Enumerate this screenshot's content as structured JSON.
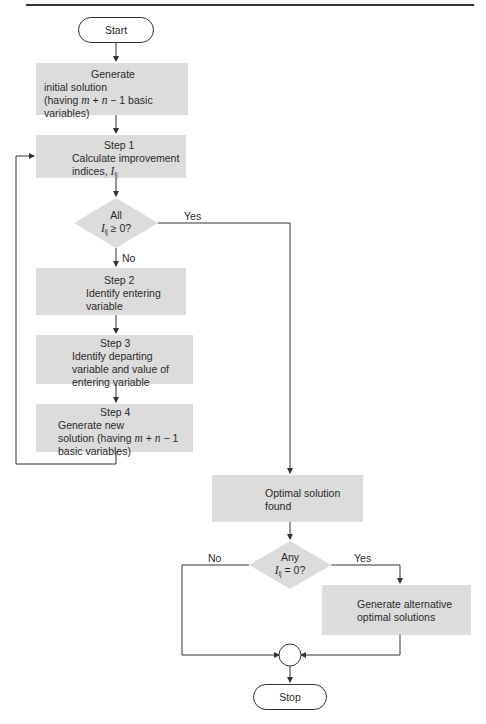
{
  "diagram": {
    "start": {
      "label": "Start"
    },
    "stop": {
      "label": "Stop"
    },
    "generate_initial": {
      "title": "Generate",
      "lines": [
        "initial solution",
        "(having m + n − 1 basic variables)"
      ]
    },
    "step1": {
      "title": "Step 1",
      "lines": [
        "Calculate improvement",
        "indices, Iᵢⱼ"
      ]
    },
    "decision_all": {
      "lines": [
        "All",
        "Iᵢⱼ ≥ 0?"
      ],
      "yes_label": "Yes",
      "no_label": "No"
    },
    "step2": {
      "title": "Step 2",
      "lines": [
        "Identify entering",
        "variable"
      ]
    },
    "step3": {
      "title": "Step 3",
      "lines": [
        "Identify departing",
        "variable and value of",
        "entering variable"
      ]
    },
    "step4": {
      "title": "Step 4",
      "lines": [
        "Generate new",
        "solution (having m + n − 1",
        "basic variables)"
      ]
    },
    "optimal": {
      "lines": [
        "Optimal solution",
        "found"
      ]
    },
    "decision_any": {
      "lines": [
        "Any",
        "Iᵢⱼ = 0?"
      ],
      "yes_label": "Yes",
      "no_label": "No"
    },
    "alternative": {
      "lines": [
        "Generate alternative",
        "optimal solutions"
      ]
    }
  },
  "colors": {
    "box_fill": "#dcdcdc",
    "line": "#333333"
  }
}
